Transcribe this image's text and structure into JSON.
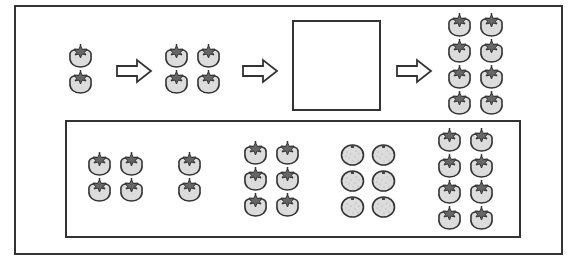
{
  "diagram": {
    "colors": {
      "outline": "#333333",
      "fruit_fill": "#dcdcdc",
      "leaf_fill": "#666666",
      "background": "#ffffff"
    },
    "sequence": [
      {
        "type": "group",
        "fruit": "persimmon",
        "count": 2,
        "columns": 1
      },
      {
        "type": "arrow",
        "direction": "right"
      },
      {
        "type": "group",
        "fruit": "persimmon",
        "count": 4,
        "columns": 2
      },
      {
        "type": "arrow",
        "direction": "right"
      },
      {
        "type": "blank",
        "label": "answer box (empty)"
      },
      {
        "type": "arrow",
        "direction": "right"
      },
      {
        "type": "group",
        "fruit": "persimmon",
        "count": 8,
        "columns": 2
      }
    ],
    "choices": [
      {
        "fruit": "persimmon",
        "count": 4,
        "columns": 2
      },
      {
        "fruit": "persimmon",
        "count": 2,
        "columns": 1
      },
      {
        "fruit": "persimmon",
        "count": 6,
        "columns": 2
      },
      {
        "fruit": "orange",
        "count": 6,
        "columns": 2
      },
      {
        "fruit": "persimmon",
        "count": 8,
        "columns": 2
      }
    ]
  }
}
